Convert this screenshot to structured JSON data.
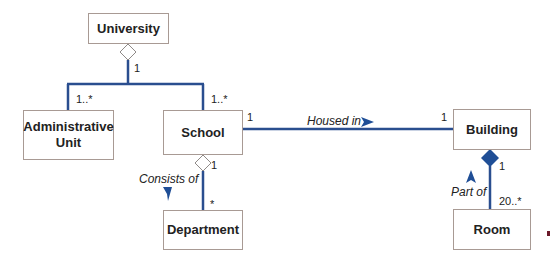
{
  "colors": {
    "line": "#2a4e8f",
    "box_border": "#a89a94",
    "diamond_filled": "#1f4e96",
    "arrow": "#1f4e96"
  },
  "classes": {
    "university": "University",
    "administrative_unit_line1": "Administrative",
    "administrative_unit_line2": "Unit",
    "school": "School",
    "department": "Department",
    "building": "Building",
    "room": "Room"
  },
  "multiplicities": {
    "university_side": "1",
    "admin_unit_side": "1..*",
    "school_side_university": "1..*",
    "school_housed_in": "1",
    "building_housed_in": "1",
    "school_consists_of": "1",
    "department_side": "*",
    "building_part_of": "1",
    "room_side": "20..*"
  },
  "associations": {
    "housed_in": "Housed in",
    "consists_of": "Consists of",
    "part_of": "Part of"
  }
}
